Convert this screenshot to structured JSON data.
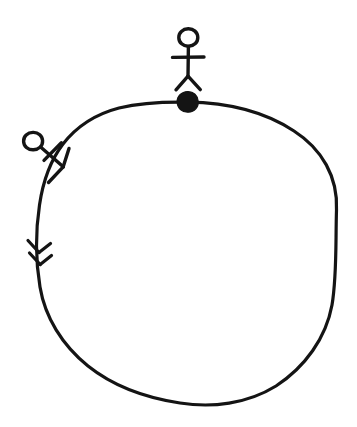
{
  "figure": {
    "title": "Hand-drawn cycle diagram with two actors",
    "background_color": "#ffffff",
    "ink_color": "#141414",
    "width": 357,
    "height": 427,
    "style": "hand-drawn sketch, black ink on white"
  },
  "chart_data": {
    "type": "diagram",
    "title": "Hand-drawn cycle diagram with two actors",
    "shapes": [
      {
        "name": "main-cycle-circle",
        "kind": "circle",
        "cx": 187,
        "cy": 252,
        "r": 150,
        "stroke_width": 3,
        "filled": false
      },
      {
        "name": "top-node-dot",
        "kind": "filled-circle",
        "cx": 187,
        "cy": 102,
        "r": 10,
        "filled": true,
        "position_on_circle": "top"
      },
      {
        "name": "direction-double-chevron",
        "kind": "double-arrowhead",
        "x": 37,
        "y": 252,
        "direction": "clockwise-downward",
        "position_on_circle": "left"
      }
    ],
    "actors": [
      {
        "name": "top-actor",
        "kind": "stick-figure",
        "head_cx": 188,
        "head_cy": 37,
        "head_r": 8,
        "rotation_deg": 0,
        "anchor": "top-node-dot",
        "label": ""
      },
      {
        "name": "left-actor",
        "kind": "stick-figure",
        "head_cx": 33,
        "head_cy": 141,
        "head_r": 8,
        "rotation_deg": 45,
        "anchor": "upper-left-arc",
        "label": ""
      }
    ],
    "annotations": [],
    "legend": [],
    "xlabel": "",
    "ylabel": ""
  },
  "accessibility": {
    "circle_alt": "Large circle representing a cycle or loop",
    "top_dot_alt": "Filled black node at the top of the circle",
    "top_actor_alt": "Stick figure standing on top node",
    "left_actor_alt": "Tilted stick figure attached to upper left of circle",
    "chevron_alt": "Double arrowhead showing flow direction along the circle"
  }
}
